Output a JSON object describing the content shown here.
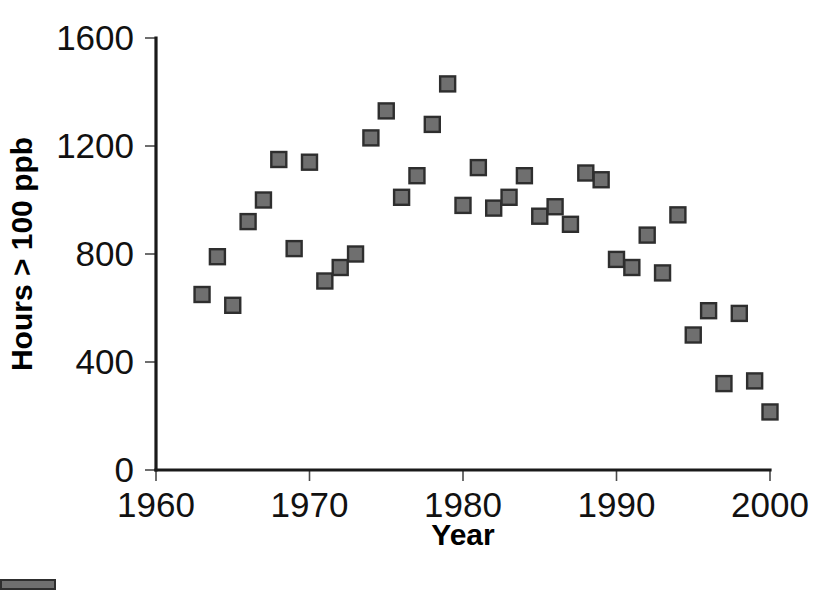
{
  "chart_data": {
    "type": "scatter",
    "title": "",
    "xlabel": "Year",
    "ylabel": "Hours > 100 ppb",
    "xlim": [
      1960,
      2000
    ],
    "ylim": [
      0,
      1600
    ],
    "xticks": [
      1960,
      1970,
      1980,
      1990,
      2000
    ],
    "yticks": [
      0,
      400,
      800,
      1200,
      1600
    ],
    "xtick_labels": [
      "1960",
      "1970",
      "1980",
      "1990",
      "2000"
    ],
    "ytick_labels": [
      "0",
      "400",
      "800",
      "1200",
      "1600"
    ],
    "grid": false,
    "legend": null,
    "marker": {
      "shape": "square",
      "fill_color": "#6f6f6f",
      "edge_color": "#2e2e2e",
      "size_px": 15
    },
    "series": [
      {
        "name": "Hours above 100 ppb",
        "x": [
          1963,
          1964,
          1965,
          1966,
          1967,
          1968,
          1969,
          1970,
          1971,
          1972,
          1973,
          1974,
          1975,
          1976,
          1977,
          1978,
          1979,
          1980,
          1981,
          1982,
          1983,
          1984,
          1985,
          1986,
          1987,
          1988,
          1989,
          1990,
          1991,
          1992,
          1993,
          1994,
          1995,
          1996,
          1997,
          1998,
          1999,
          2000
        ],
        "y": [
          650,
          790,
          610,
          920,
          1000,
          1150,
          820,
          1140,
          700,
          750,
          800,
          1230,
          1330,
          1010,
          1090,
          1280,
          1430,
          980,
          1120,
          970,
          1010,
          1090,
          940,
          975,
          910,
          1100,
          1075,
          780,
          750,
          870,
          730,
          945,
          500,
          590,
          320,
          580,
          330,
          215
        ]
      }
    ]
  },
  "axes": {
    "x_axis_label": "Year",
    "y_axis_label": "Hours > 100 ppb"
  },
  "colors": {
    "marker_fill": "#6f6f6f",
    "marker_edge": "#2e2e2e",
    "axis": "#1a1a1a",
    "text": "#111111",
    "background": "#ffffff"
  }
}
